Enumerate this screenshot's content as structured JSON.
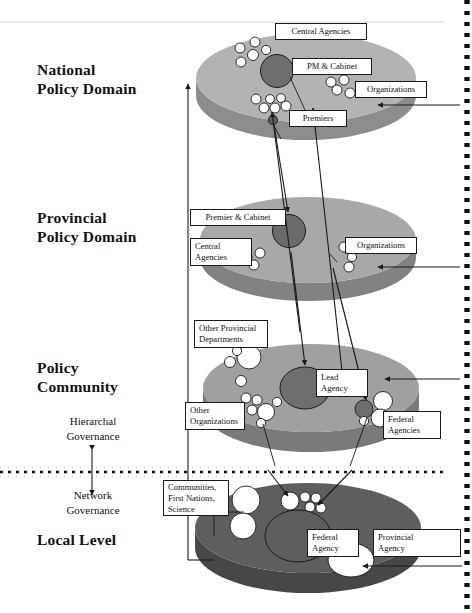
{
  "figure": {
    "type": "layered-ellipse-diagram"
  },
  "levels": [
    {
      "id": "national",
      "label": "National\nPolicy Domain",
      "disc_top": "#b3b3b3",
      "disc_side": "#8c8c8c"
    },
    {
      "id": "provincial",
      "label": "Provincial\nPolicy Domain",
      "disc_top": "#a8a8a8",
      "disc_side": "#828282"
    },
    {
      "id": "community",
      "label": "Policy\nCommunity",
      "disc_top": "#a0a0a0",
      "disc_side": "#7a7a7a"
    },
    {
      "id": "local",
      "label": "Local Level",
      "disc_top": "#5e5e5e",
      "disc_side": "#474747"
    }
  ],
  "governance": {
    "upper": "Hierarchal\nGovernance",
    "lower": "Network\nGovernance"
  },
  "callouts": {
    "central_agencies_national": "Central Agencies",
    "pm_cabinet": "PM & Cabinet",
    "organizations_national": "Organizations",
    "premiers": "Premiers",
    "premier_cabinet": "Premier & Cabinet",
    "central_agencies_provincial": "Central\nAgencies",
    "organizations_provincial": "Organizations",
    "other_provincial_departments": "Other Provincial\nDepartments",
    "lead_agency": "Lead\nAgency",
    "other_organizations": "Other\nOrganizations",
    "federal_agencies": "Federal\nAgencies",
    "communities_first_nations_science": "Communities,\nFirst Nations,\nScience",
    "federal_agency": "Federal\nAgency",
    "provincial_agency": "Provincial\nAgency"
  },
  "colors": {
    "line": "#1a1a1a",
    "node_fill": "#ffffff",
    "node_stroke": "#1a1a1a",
    "hub_national": "#6e6e6e",
    "hub_provincial": "#6b6b6b",
    "hub_community": "#6e6e6e",
    "border_dash": "#111111",
    "divider": "#111111"
  }
}
